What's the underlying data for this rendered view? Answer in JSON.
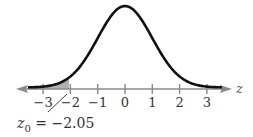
{
  "chart_data": {
    "type": "line",
    "title": "",
    "xlabel": "z",
    "ylabel": "",
    "x_ticks": [
      -3,
      -2,
      -1,
      0,
      1,
      2,
      3
    ],
    "tick_labels": [
      "−3",
      "−2",
      "−1",
      "0",
      "1",
      "2",
      "3"
    ],
    "xlim": [
      -4,
      4
    ],
    "shaded_region": {
      "from": "-inf",
      "to": -2.05,
      "color": "#b0b0b0"
    },
    "annotation": {
      "text_var": "z",
      "subscript": "0",
      "text_rest": " = −2.05",
      "points_to": -2.05
    },
    "grid": false,
    "legend": null
  },
  "colors": {
    "curve": "#111111",
    "axis": "#8a8a8a",
    "shade": "#b5b5b5"
  }
}
